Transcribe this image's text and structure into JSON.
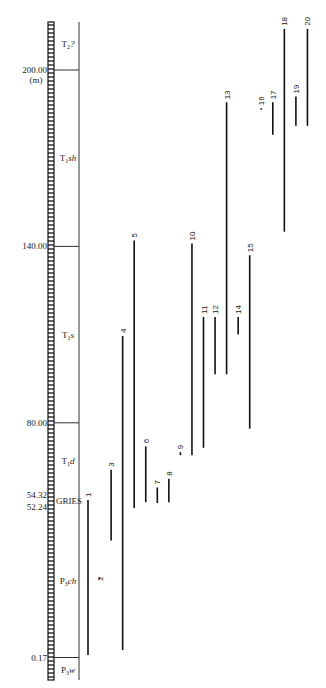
{
  "chart_data": {
    "type": "range-bar",
    "title": "",
    "ylabel": "(m)",
    "orientation": "vertical stratigraphic ranges",
    "ylim": [
      0,
      218
    ],
    "y_ticks": [
      {
        "value": 200.0,
        "label": "200.00"
      },
      {
        "value": 140.0,
        "label": "140.00"
      },
      {
        "value": 80.0,
        "label": "80.00"
      },
      {
        "value": 54.32,
        "label": "54.32"
      },
      {
        "value": 52.24,
        "label": "52.24"
      },
      {
        "value": 0.17,
        "label": "0.17"
      }
    ],
    "unit_label": "(m)",
    "boundary_marker": {
      "value": 53.3,
      "label": "GRIES"
    },
    "units": [
      {
        "name": "P3w",
        "base": "P",
        "sub": "3",
        "suffix": "w",
        "from": -8,
        "to": 0.17
      },
      {
        "name": "P3ch",
        "base": "P",
        "sub": "3",
        "suffix": "ch",
        "from": 0.17,
        "to": 52.24
      },
      {
        "name": "T1d",
        "base": "T",
        "sub": "1",
        "suffix": "d",
        "from": 54.32,
        "to": 80.0
      },
      {
        "name": "T1s",
        "base": "T",
        "sub": "1",
        "suffix": "s",
        "from": 80.0,
        "to": 140.0
      },
      {
        "name": "T1sh",
        "base": "T",
        "sub": "1",
        "suffix": "sh",
        "from": 140.0,
        "to": 200.0
      },
      {
        "name": "T2?",
        "base": "T",
        "sub": "2",
        "suffix": "?",
        "from": 200.0,
        "to": 218.0
      }
    ],
    "series": [
      {
        "name": "1",
        "from": 1.0,
        "to": 53.7
      },
      {
        "name": "2",
        "from": 27.0,
        "to": 27.0
      },
      {
        "name": "3",
        "from": 40.0,
        "to": 64.0
      },
      {
        "name": "4",
        "from": 2.7,
        "to": 109.5
      },
      {
        "name": "5",
        "from": 51.0,
        "to": 142.0
      },
      {
        "name": "6",
        "from": 53.0,
        "to": 72.0
      },
      {
        "name": "7",
        "from": 52.7,
        "to": 58.0
      },
      {
        "name": "8",
        "from": 53.0,
        "to": 61.0
      },
      {
        "name": "9",
        "from": 69.0,
        "to": 70.0
      },
      {
        "name": "10",
        "from": 69.0,
        "to": 141.0
      },
      {
        "name": "11",
        "from": 71.5,
        "to": 116.0
      },
      {
        "name": "12",
        "from": 96.5,
        "to": 116.0
      },
      {
        "name": "13",
        "from": 96.5,
        "to": 189.0
      },
      {
        "name": "14",
        "from": 110.0,
        "to": 116.0
      },
      {
        "name": "15",
        "from": 78.0,
        "to": 137.0
      },
      {
        "name": "16",
        "from": 186.5,
        "to": 187.0
      },
      {
        "name": "17",
        "from": 178.0,
        "to": 189.0
      },
      {
        "name": "18",
        "from": 145.0,
        "to": 214.0
      },
      {
        "name": "19",
        "from": 181.0,
        "to": 191.0
      },
      {
        "name": "20",
        "from": 181.0,
        "to": 214.0
      }
    ],
    "grid": false,
    "legend": "none"
  }
}
